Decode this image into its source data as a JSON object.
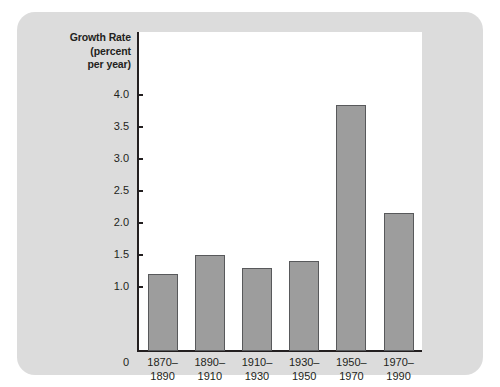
{
  "chart_data": {
    "type": "bar",
    "title": "",
    "ylabel": "Growth Rate (percent per year)",
    "ylabel_lines": [
      "Growth Rate",
      "(percent",
      "per year)"
    ],
    "xlabel": "",
    "categories": [
      "1870–\n1890",
      "1890–\n1910",
      "1910–\n1930",
      "1930–\n1950",
      "1950–\n1970",
      "1970–\n1990"
    ],
    "category_lines": [
      [
        "1870–",
        "1890"
      ],
      [
        "1890–",
        "1910"
      ],
      [
        "1910–",
        "1930"
      ],
      [
        "1930–",
        "1950"
      ],
      [
        "1950–",
        "1970"
      ],
      [
        "1970–",
        "1990"
      ]
    ],
    "values": [
      1.2,
      1.5,
      1.3,
      1.4,
      3.85,
      2.15
    ],
    "ylim": [
      0,
      4.25
    ],
    "yticks": [
      1.0,
      1.5,
      2.0,
      2.5,
      3.0,
      3.5,
      4.0
    ],
    "ytick_labels": [
      "1.0",
      "1.5",
      "2.0",
      "2.5",
      "3.0",
      "3.5",
      "4.0"
    ],
    "zero_label": "0",
    "grid": false,
    "legend": null,
    "bar_color": "#9d9d9d",
    "bar_border_color": "#58595b",
    "panel_color": "#ffffff",
    "card_color": "#dcdcdc",
    "axis_color": "#231f20"
  }
}
